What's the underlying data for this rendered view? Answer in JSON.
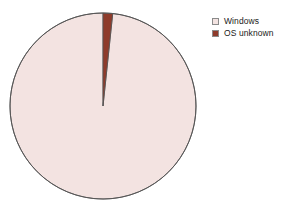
{
  "chart_data": {
    "type": "pie",
    "title": "",
    "subtitle": "",
    "xlabel": "",
    "ylabel": "",
    "categories": [
      "Windows",
      "OS unknown"
    ],
    "values": [
      98.3,
      1.7
    ],
    "units": "percent",
    "slices": [
      {
        "label": "Windows",
        "value": 98.3,
        "color": "#f3e3e1",
        "start_angle_deg": 6,
        "end_angle_deg": 360
      },
      {
        "label": "OS unknown",
        "value": 1.7,
        "color": "#8e3b2b",
        "start_angle_deg": 0,
        "end_angle_deg": 6
      }
    ],
    "legend": {
      "position": "top-right",
      "entries": [
        {
          "label": "Windows",
          "color": "#f3e3e1",
          "border": "#8a8a8a"
        },
        {
          "label": "OS unknown",
          "color": "#8e3b2b",
          "border": "#8a8a8a"
        }
      ]
    },
    "grid": false,
    "background_color": "#ffffff",
    "outline_color": "#555555",
    "start_angle_position": "12-oclock",
    "direction": "clockwise"
  },
  "geometry": {
    "center_x": 103,
    "center_y": 106,
    "radius": 93
  }
}
